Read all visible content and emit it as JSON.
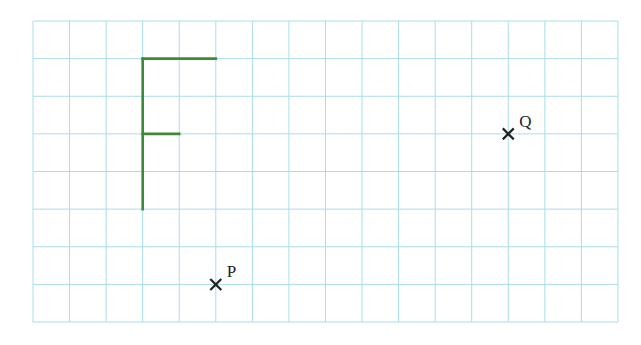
{
  "grid": {
    "origin_x": 33,
    "origin_y": 21,
    "cols": 16,
    "rows": 8,
    "cell_w": 36.56,
    "cell_h": 37.63,
    "line_color": "#a9dde9"
  },
  "shape": {
    "name": "F",
    "color": "#3d8b37",
    "segments": [
      {
        "from": [
          3,
          1
        ],
        "to": [
          3,
          5
        ]
      },
      {
        "from": [
          3,
          1
        ],
        "to": [
          5,
          1
        ]
      },
      {
        "from": [
          3,
          3
        ],
        "to": [
          4,
          3
        ]
      }
    ]
  },
  "points": [
    {
      "label": "Q",
      "col": 13,
      "row": 3
    },
    {
      "label": "P",
      "col": 5,
      "row": 7
    }
  ],
  "marker_color": "#222222"
}
